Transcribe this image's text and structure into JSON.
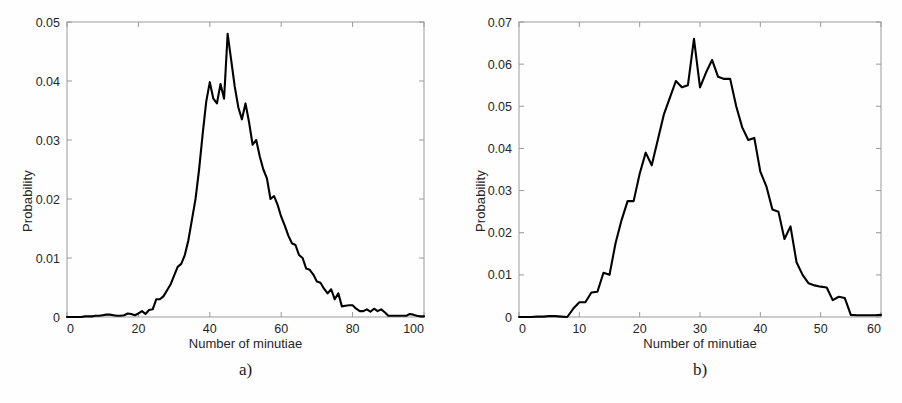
{
  "figure": {
    "background_color": "#fefefe",
    "line_color": "#000000",
    "axis_color": "#9a9a9a",
    "text_color": "#262626"
  },
  "panels": [
    {
      "id": "a",
      "caption": "a)",
      "xlabel": "Number of minutiae",
      "ylabel": "Probability",
      "xticks": [
        "0",
        "20",
        "40",
        "60",
        "80",
        "100"
      ],
      "yticks": [
        "0",
        "0.01",
        "0.02",
        "0.03",
        "0.04",
        "0.05"
      ]
    },
    {
      "id": "b",
      "caption": "b)",
      "xlabel": "Number of minutiae",
      "ylabel": "Probability",
      "xticks": [
        "0",
        "10",
        "20",
        "30",
        "40",
        "50",
        "60"
      ],
      "yticks": [
        "0",
        "0.01",
        "0.02",
        "0.03",
        "0.04",
        "0.05",
        "0.06",
        "0.07"
      ]
    }
  ],
  "chart_data": [
    {
      "type": "line",
      "panel": "a",
      "title": "a)",
      "xlabel": "Number of minutiae",
      "ylabel": "Probability",
      "xlim": [
        0,
        100
      ],
      "ylim": [
        0,
        0.05
      ],
      "xticks": [
        0,
        20,
        40,
        60,
        80,
        100
      ],
      "yticks": [
        0,
        0.01,
        0.02,
        0.03,
        0.04,
        0.05
      ],
      "grid": false,
      "legend": null,
      "x": [
        0,
        1,
        2,
        3,
        4,
        5,
        6,
        7,
        8,
        9,
        10,
        11,
        12,
        13,
        14,
        15,
        16,
        17,
        18,
        19,
        20,
        21,
        22,
        23,
        24,
        25,
        26,
        27,
        28,
        29,
        30,
        31,
        32,
        33,
        34,
        35,
        36,
        37,
        38,
        39,
        40,
        41,
        42,
        43,
        44,
        45,
        46,
        47,
        48,
        49,
        50,
        51,
        52,
        53,
        54,
        55,
        56,
        57,
        58,
        59,
        60,
        61,
        62,
        63,
        64,
        65,
        66,
        67,
        68,
        69,
        70,
        71,
        72,
        73,
        74,
        75,
        76,
        77,
        78,
        79,
        80,
        81,
        82,
        83,
        84,
        85,
        86,
        87,
        88,
        89,
        90,
        91,
        92,
        93,
        94,
        95,
        96,
        97,
        98,
        99,
        100
      ],
      "y": [
        0.0,
        0.0,
        0.0,
        0.0,
        0.0,
        0.0001,
        0.0001,
        0.0001,
        0.0002,
        0.0002,
        0.0003,
        0.0004,
        0.0004,
        0.0003,
        0.0002,
        0.0002,
        0.0003,
        0.0006,
        0.0005,
        0.0003,
        0.0006,
        0.001,
        0.0005,
        0.0012,
        0.0013,
        0.003,
        0.003,
        0.0035,
        0.0045,
        0.0055,
        0.007,
        0.0085,
        0.009,
        0.0105,
        0.013,
        0.0165,
        0.02,
        0.025,
        0.031,
        0.0365,
        0.0398,
        0.037,
        0.0362,
        0.0395,
        0.037,
        0.048,
        0.0435,
        0.039,
        0.0355,
        0.0335,
        0.0362,
        0.033,
        0.0292,
        0.03,
        0.0272,
        0.025,
        0.0235,
        0.02,
        0.0205,
        0.019,
        0.017,
        0.0155,
        0.0138,
        0.0125,
        0.0122,
        0.0105,
        0.01,
        0.0082,
        0.008,
        0.0072,
        0.006,
        0.0058,
        0.0048,
        0.004,
        0.0047,
        0.003,
        0.004,
        0.0018,
        0.0019,
        0.002,
        0.002,
        0.0014,
        0.001,
        0.001,
        0.0013,
        0.0009,
        0.0014,
        0.001,
        0.0013,
        0.0008,
        0.0002,
        0.0002,
        0.0002,
        0.0002,
        0.0002,
        0.0002,
        0.0005,
        0.0004,
        0.0002,
        0.0001,
        0.0001
      ]
    },
    {
      "type": "line",
      "panel": "b",
      "title": "b)",
      "xlabel": "Number of minutiae",
      "ylabel": "Probability",
      "xlim": [
        0,
        60
      ],
      "ylim": [
        0,
        0.07
      ],
      "xticks": [
        0,
        10,
        20,
        30,
        40,
        50,
        60
      ],
      "yticks": [
        0,
        0.01,
        0.02,
        0.03,
        0.04,
        0.05,
        0.06,
        0.07
      ],
      "grid": false,
      "legend": null,
      "x": [
        0,
        1,
        2,
        3,
        4,
        5,
        6,
        7,
        8,
        9,
        10,
        11,
        12,
        13,
        14,
        15,
        16,
        17,
        18,
        19,
        20,
        21,
        22,
        23,
        24,
        25,
        26,
        27,
        28,
        29,
        30,
        31,
        32,
        33,
        34,
        35,
        36,
        37,
        38,
        39,
        40,
        41,
        42,
        43,
        44,
        45,
        46,
        47,
        48,
        49,
        50,
        51,
        52,
        53,
        54,
        55,
        56,
        57,
        58,
        59,
        60
      ],
      "y": [
        0.0,
        0.0,
        0.0,
        0.0001,
        0.0001,
        0.0002,
        0.0002,
        0.0001,
        0.0,
        0.002,
        0.0035,
        0.0035,
        0.0058,
        0.006,
        0.0105,
        0.01,
        0.0175,
        0.023,
        0.0275,
        0.0275,
        0.034,
        0.039,
        0.036,
        0.042,
        0.048,
        0.052,
        0.056,
        0.0545,
        0.055,
        0.066,
        0.0545,
        0.058,
        0.061,
        0.057,
        0.0565,
        0.0565,
        0.05,
        0.045,
        0.042,
        0.0425,
        0.0345,
        0.031,
        0.0255,
        0.025,
        0.0185,
        0.0215,
        0.013,
        0.01,
        0.008,
        0.0075,
        0.0072,
        0.007,
        0.004,
        0.0048,
        0.0045,
        0.0005,
        0.0004,
        0.0004,
        0.0004,
        0.0004,
        0.0005
      ]
    }
  ],
  "bottom_text": ""
}
